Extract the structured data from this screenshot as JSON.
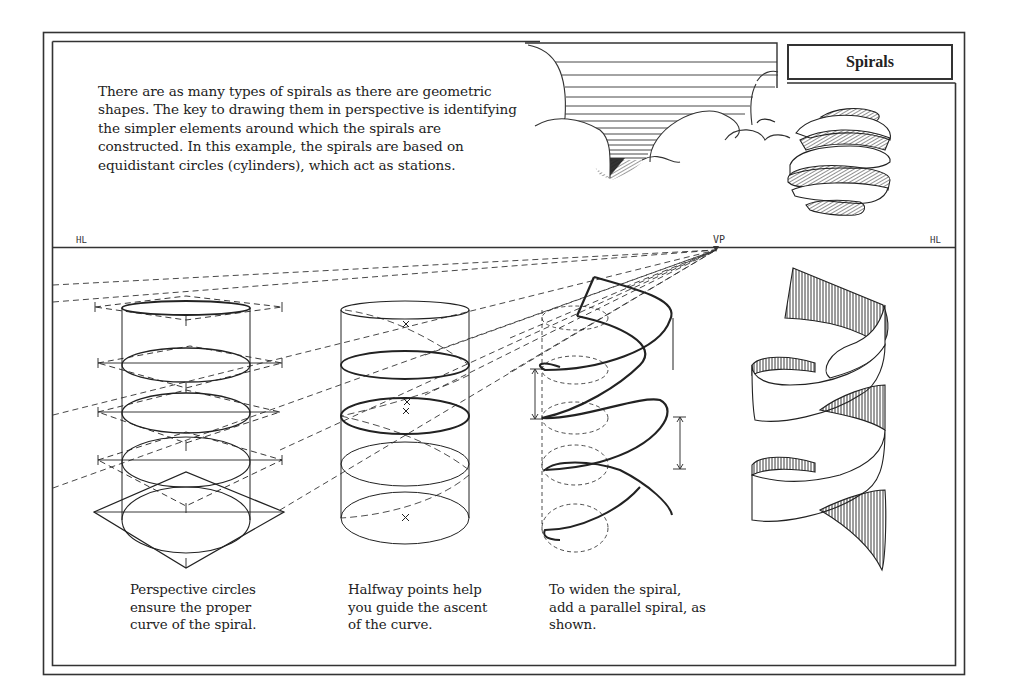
{
  "page": {
    "title": "Spirals",
    "intro_lines": [
      "There are as many types of spirals as there are geometric",
      "shapes. The key to drawing them in perspective is identifying",
      "the simpler elements around which the spirals are",
      "constructed. In this example, the spirals are based on",
      "equidistant circles (cylinders), which act as stations."
    ],
    "horizon": {
      "left_label": "HL",
      "right_label": "HL",
      "vanishing_point_label": "VP"
    },
    "illustrations": [
      {
        "name": "perspective-circles",
        "caption_lines": [
          "Perspective circles",
          "ensure the proper",
          "curve of the spiral."
        ]
      },
      {
        "name": "halfway-points",
        "caption_lines": [
          "Halfway points help",
          "you guide the ascent",
          "of the curve."
        ]
      },
      {
        "name": "widened-spiral",
        "caption_lines": [
          "To widen the spiral,",
          "add a parallel spiral, as",
          "shown."
        ]
      },
      {
        "name": "finished-ribbon-spiral",
        "caption_lines": []
      }
    ],
    "decor": {
      "top_illustration": "cloud-funnel",
      "sphere_illustration": "spiral-ribbon-sphere"
    },
    "colors": {
      "ink": "#222222",
      "paper": "#ffffff",
      "frame": "#333333"
    }
  }
}
